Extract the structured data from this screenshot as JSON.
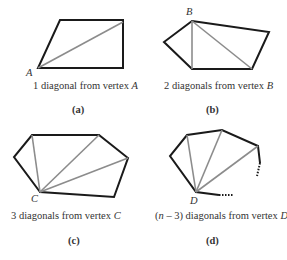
{
  "panels": [
    {
      "id": "a",
      "vertex_label": "A",
      "caption_prefix": "1 diagonal from vertex ",
      "caption_vertex": "A",
      "sub_label": "(a)",
      "sides": 4,
      "diagonals": 1
    },
    {
      "id": "b",
      "vertex_label": "B",
      "caption_prefix": "2 diagonals from vertex ",
      "caption_vertex": "B",
      "sub_label": "(b)",
      "sides": 5,
      "diagonals": 2
    },
    {
      "id": "c",
      "vertex_label": "C",
      "caption_prefix": "3 diagonals from vertex ",
      "caption_vertex": "C",
      "sub_label": "(c)",
      "sides": 6,
      "diagonals": 3
    },
    {
      "id": "d",
      "vertex_label": "D",
      "caption_n": "n",
      "caption_prefix": " – 3) diagonals from vertex ",
      "caption_open": "(",
      "caption_vertex": "D",
      "sub_label": "(d)",
      "sides": "n",
      "diagonals": "n – 3"
    }
  ],
  "colors": {
    "edge": "#1a1a1a",
    "diagonal": "#8c8c8c"
  }
}
